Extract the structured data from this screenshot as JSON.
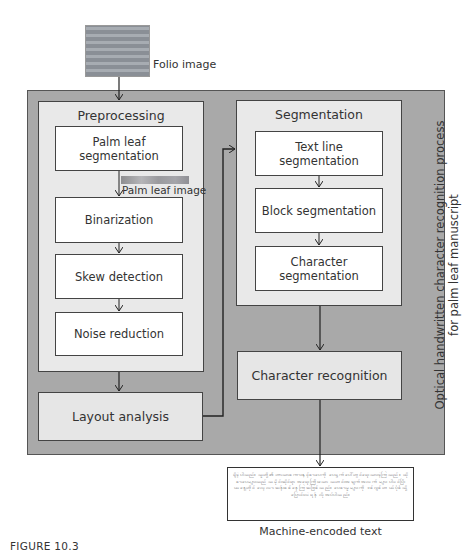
{
  "inputs": {
    "folio_image_label": "Folio image",
    "palm_leaf_image_label": "Palm leaf image"
  },
  "outer_process": {
    "title_line1": "Optical handwritten character recognition process",
    "title_line2": "for palm leaf manuscript"
  },
  "preprocessing": {
    "title": "Preprocessing",
    "steps": [
      "Palm leaf segmentation",
      "Binarization",
      "Skew detection",
      "Noise reduction"
    ]
  },
  "layout_analysis": {
    "label": "Layout analysis"
  },
  "segmentation": {
    "title": "Segmentation",
    "steps": [
      "Text line segmentation",
      "Block segmentation",
      "Character segmentation"
    ]
  },
  "character_recognition": {
    "label": "Character recognition"
  },
  "output": {
    "sample_text": "ရှိခဲ့ပါသည်။ သူတို့၏ဘာသာစကားနှင့်စာပေကို ပေရွက်ပေါ်တွင်ရေးသားခဲ့ကြသည်။ ထိုစာပေများသည် သမိုင်းဆိုင်ရာ အရေးကြီးသော သတင်းအချက်အလက်များ ပါဝင်ပြီး ယနေ့တိုင် လေ့လာဆန်းစစ်နေကြဆဲဖြစ်သည်။ ပေစာမူများကို ဒစ်ဂျစ်တယ်ပုံစံသို့ ပြောင်းလဲရန် လိုအပ်ပါသည်။",
    "caption": "Machine-encoded text"
  },
  "figure_label": "FIGURE 10.3"
}
